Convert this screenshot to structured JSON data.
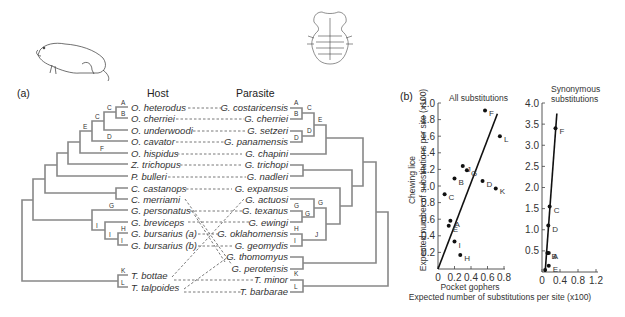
{
  "panel_a": {
    "label": "(a)",
    "host_header": "Host",
    "parasite_header": "Parasite",
    "associations": [
      {
        "host": "O. heterodus",
        "parasite": "G. costaricensis"
      },
      {
        "host": "O. cherriei",
        "parasite": "G. cherriei"
      },
      {
        "host": "O. underwoodi",
        "parasite": "G. setzeri"
      },
      {
        "host": "O. cavator",
        "parasite": "G. panamensis"
      },
      {
        "host": "O. hispidus",
        "parasite": "G. chapini"
      },
      {
        "host": "Z. trichopus",
        "parasite": "G. trichopi"
      },
      {
        "host": "P. bulleri",
        "parasite": "G. nadleri"
      },
      {
        "host": "C. castanops",
        "parasite": "G. expansus"
      },
      {
        "host": "C. merriami",
        "parasite": "G. actuosi"
      },
      {
        "host": "G. personatus",
        "parasite": "G. texanus"
      },
      {
        "host": "G. breviceps",
        "parasite": "G. ewingi"
      },
      {
        "host": "G. bursarius (a)",
        "parasite": "G. oklahomensis"
      },
      {
        "host": "G. bursarius (b)",
        "parasite": "G. geomydis"
      },
      {
        "host": "",
        "parasite": "G. thomomyus"
      },
      {
        "host": "",
        "parasite": "G. perotensis"
      },
      {
        "host": "T. bottae",
        "parasite": "T. minor"
      },
      {
        "host": "T. talpoides",
        "parasite": "T. barbarae"
      }
    ],
    "host_node_labels": [
      "A",
      "B",
      "C",
      "C",
      "D",
      "E",
      "F",
      "G",
      "I",
      "I",
      "H",
      "I",
      "K",
      "L"
    ],
    "parasite_node_labels": [
      "A",
      "B",
      "C",
      "D",
      "D",
      "E",
      "G",
      "G",
      "G",
      "H",
      "I",
      "J",
      "K",
      "L"
    ],
    "illustrations": [
      "pocket-gopher-drawing",
      "chewing-louse-drawing"
    ]
  },
  "panel_b": {
    "label": "(b)",
    "ylabel_line1": "Chewing lice",
    "ylabel_line2": "Expected number of substitutions per site (x100)",
    "xlabel_line1": "Pocket gophers",
    "xlabel_line2": "Expected number of substitutions per site (x100)"
  },
  "chart_data": [
    {
      "type": "scatter",
      "title": "All substitutions",
      "xlabel": "Pocket gophers — Expected number of substitutions per site (x100)",
      "ylabel": "Chewing lice — Expected number of substitutions per site (x100)",
      "xlim": [
        0,
        0.8
      ],
      "ylim": [
        0,
        2.0
      ],
      "xticks": [
        "0",
        "0.2",
        "0.4",
        "0.6",
        "0.8"
      ],
      "yticks": [
        "0.2",
        "0.4",
        "0.6",
        "0.8",
        "1.0",
        "1.2",
        "1.4",
        "1.6",
        "1.8",
        "2.0"
      ],
      "grid": false,
      "points": [
        {
          "label": "F",
          "x": 0.57,
          "y": 1.91
        },
        {
          "label": "L",
          "x": 0.75,
          "y": 1.6
        },
        {
          "label": "J",
          "x": 0.3,
          "y": 1.24
        },
        {
          "label": "G",
          "x": 0.35,
          "y": 1.19
        },
        {
          "label": "B",
          "x": 0.2,
          "y": 1.09
        },
        {
          "label": "D",
          "x": 0.54,
          "y": 1.06
        },
        {
          "label": "K",
          "x": 0.7,
          "y": 0.97
        },
        {
          "label": "C",
          "x": 0.08,
          "y": 0.9
        },
        {
          "label": "A",
          "x": 0.15,
          "y": 0.58
        },
        {
          "label": "E",
          "x": 0.13,
          "y": 0.52
        },
        {
          "label": "I",
          "x": 0.2,
          "y": 0.33
        },
        {
          "label": "H",
          "x": 0.27,
          "y": 0.17
        }
      ],
      "regression_line": {
        "x": [
          0,
          0.72
        ],
        "y": [
          0,
          1.87
        ]
      }
    },
    {
      "type": "scatter",
      "title": "Synonymous substitutions",
      "xlabel": "Pocket gophers — Expected number of substitutions per site (x100)",
      "ylabel": "Chewing lice — Expected number of substitutions per site (x100)",
      "xlim": [
        0,
        1.2
      ],
      "ylim": [
        0,
        4.0
      ],
      "xticks": [
        "0",
        "0.4",
        "0.8",
        "1.2"
      ],
      "yticks": [
        "0.5",
        "1.0",
        "1.5",
        "2.0",
        "2.5",
        "3.0",
        "3.5",
        "4.0"
      ],
      "grid": false,
      "points": [
        {
          "label": "F",
          "x": 0.3,
          "y": 3.4
        },
        {
          "label": "C",
          "x": 0.17,
          "y": 1.55
        },
        {
          "label": "D",
          "x": 0.14,
          "y": 1.1
        },
        {
          "label": "B",
          "x": 0.12,
          "y": 0.45
        },
        {
          "label": "A",
          "x": 0.15,
          "y": 0.45
        },
        {
          "label": "E",
          "x": 0.15,
          "y": 0.15
        },
        {
          "label": "",
          "x": 0.07,
          "y": 0.05
        }
      ],
      "regression_line": {
        "x": [
          0.07,
          0.33
        ],
        "y": [
          0,
          3.75
        ]
      }
    }
  ]
}
